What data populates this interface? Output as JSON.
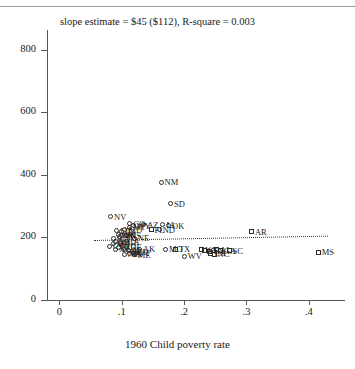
{
  "chart_data": {
    "type": "scatter",
    "title": "slope estimate = $45 ($112), R-square = 0.003",
    "xlabel": "1960 Child poverty rate",
    "ylabel": "",
    "xlim": [
      -0.02,
      0.45
    ],
    "ylim": [
      0,
      850
    ],
    "xticks": [
      0,
      0.1,
      0.2,
      0.3,
      0.4
    ],
    "xticklabels": [
      "0",
      ".1",
      ".2",
      ".3",
      ".4"
    ],
    "yticks": [
      0,
      200,
      400,
      600,
      800
    ],
    "yticklabels": [
      "0",
      "200",
      "400",
      "600",
      "800"
    ],
    "grid": false,
    "legend": "none",
    "fit_line": {
      "style": "dotted",
      "slope": 45,
      "slope_se": 112,
      "r_square": 0.003,
      "x_start": 0.055,
      "y_start": 192,
      "x_end": 0.43,
      "y_end": 206
    },
    "marker_shapes": {
      "circle": "non-south",
      "square": "south"
    },
    "points": [
      {
        "label": "NM",
        "x": 0.163,
        "y": 376,
        "shape": "circle"
      },
      {
        "label": "SD",
        "x": 0.178,
        "y": 307,
        "shape": "circle"
      },
      {
        "label": "NV",
        "x": 0.082,
        "y": 266,
        "shape": "circle"
      },
      {
        "label": "AZ",
        "x": 0.135,
        "y": 240,
        "shape": "circle"
      },
      {
        "label": "OK",
        "x": 0.175,
        "y": 237,
        "shape": "circle"
      },
      {
        "label": "IA",
        "x": 0.166,
        "y": 240,
        "shape": "circle"
      },
      {
        "label": "ND",
        "x": 0.16,
        "y": 224,
        "shape": "circle"
      },
      {
        "label": "FL",
        "x": 0.147,
        "y": 224,
        "shape": "square"
      },
      {
        "label": "CO",
        "x": 0.113,
        "y": 243,
        "shape": "circle"
      },
      {
        "label": "WY",
        "x": 0.118,
        "y": 238,
        "shape": "circle"
      },
      {
        "label": "MT",
        "x": 0.112,
        "y": 233,
        "shape": "circle"
      },
      {
        "label": "MD",
        "x": 0.105,
        "y": 225,
        "shape": "circle"
      },
      {
        "label": "UT",
        "x": 0.092,
        "y": 222,
        "shape": "circle"
      },
      {
        "label": "ID",
        "x": 0.1,
        "y": 218,
        "shape": "circle"
      },
      {
        "label": "OR",
        "x": 0.094,
        "y": 209,
        "shape": "circle"
      },
      {
        "label": "WI",
        "x": 0.1,
        "y": 207,
        "shape": "circle"
      },
      {
        "label": "KS",
        "x": 0.108,
        "y": 206,
        "shape": "circle"
      },
      {
        "label": "MN",
        "x": 0.096,
        "y": 204,
        "shape": "circle"
      },
      {
        "label": "NE",
        "x": 0.12,
        "y": 198,
        "shape": "circle"
      },
      {
        "label": "WA",
        "x": 0.086,
        "y": 196,
        "shape": "circle"
      },
      {
        "label": "MI",
        "x": 0.09,
        "y": 186,
        "shape": "circle"
      },
      {
        "label": "CA",
        "x": 0.104,
        "y": 185,
        "shape": "circle"
      },
      {
        "label": "OH",
        "x": 0.098,
        "y": 182,
        "shape": "circle"
      },
      {
        "label": "CT",
        "x": 0.08,
        "y": 172,
        "shape": "circle"
      },
      {
        "label": "IL",
        "x": 0.094,
        "y": 168,
        "shape": "circle"
      },
      {
        "label": "NJ",
        "x": 0.09,
        "y": 162,
        "shape": "circle"
      },
      {
        "label": "NY",
        "x": 0.102,
        "y": 160,
        "shape": "circle"
      },
      {
        "label": "RI",
        "x": 0.11,
        "y": 158,
        "shape": "circle"
      },
      {
        "label": "PA",
        "x": 0.118,
        "y": 152,
        "shape": "circle"
      },
      {
        "label": "IN",
        "x": 0.112,
        "y": 148,
        "shape": "circle"
      },
      {
        "label": "ME",
        "x": 0.12,
        "y": 145,
        "shape": "circle"
      },
      {
        "label": "NH",
        "x": 0.104,
        "y": 146,
        "shape": "circle"
      },
      {
        "label": "VT",
        "x": 0.122,
        "y": 150,
        "shape": "circle"
      },
      {
        "label": "DE",
        "x": 0.108,
        "y": 170,
        "shape": "circle"
      },
      {
        "label": "MA",
        "x": 0.086,
        "y": 180,
        "shape": "circle"
      },
      {
        "label": "AK",
        "x": 0.128,
        "y": 162,
        "shape": "circle"
      },
      {
        "label": "MO",
        "x": 0.17,
        "y": 162,
        "shape": "circle"
      },
      {
        "label": "TX",
        "x": 0.186,
        "y": 162,
        "shape": "square"
      },
      {
        "label": "WV",
        "x": 0.2,
        "y": 140,
        "shape": "circle"
      },
      {
        "label": "KY",
        "x": 0.232,
        "y": 158,
        "shape": "square"
      },
      {
        "label": "TN",
        "x": 0.24,
        "y": 156,
        "shape": "square"
      },
      {
        "label": "AL",
        "x": 0.252,
        "y": 160,
        "shape": "square"
      },
      {
        "label": "GA",
        "x": 0.258,
        "y": 158,
        "shape": "square"
      },
      {
        "label": "LA",
        "x": 0.243,
        "y": 150,
        "shape": "square"
      },
      {
        "label": "NC",
        "x": 0.248,
        "y": 146,
        "shape": "square"
      },
      {
        "label": "VA",
        "x": 0.228,
        "y": 160,
        "shape": "square"
      },
      {
        "label": "SC",
        "x": 0.272,
        "y": 158,
        "shape": "square"
      },
      {
        "label": "AR",
        "x": 0.308,
        "y": 218,
        "shape": "square"
      },
      {
        "label": "MS",
        "x": 0.415,
        "y": 152,
        "shape": "square"
      }
    ]
  }
}
